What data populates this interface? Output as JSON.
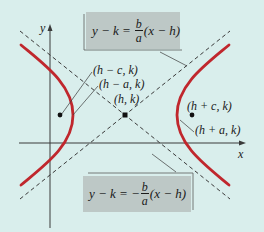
{
  "diagram": {
    "colors": {
      "background": "#d9eeec",
      "hyperbola": "#c0272d",
      "asymptote": "#3a3a3a",
      "axis": "#3a3a3a",
      "equation_box": "#bdc8c6"
    },
    "axes": {
      "x_label": "x",
      "y_label": "y"
    },
    "asymptote_upper": {
      "lhs": "y − k =",
      "num": "b",
      "den": "a",
      "rhs": "(x − h)"
    },
    "asymptote_lower": {
      "lhs": "y − k = −",
      "num": "b",
      "den": "a",
      "rhs": "(x − h)"
    },
    "points": {
      "left_focus": "(h − c, k)",
      "left_vertex": "(h − a, k)",
      "center": "(h, k)",
      "right_focus": "(h + c, k)",
      "right_vertex": "(h + a, k)"
    }
  }
}
